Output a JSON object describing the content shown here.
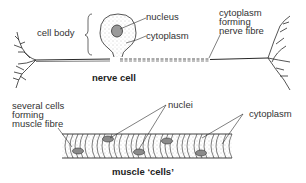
{
  "nerve_cell": {
    "caption": "nerve cell",
    "labels": {
      "cell_body": "cell body",
      "nucleus": "nucleus",
      "cytoplasm": "cytoplasm",
      "fibre_line1": "cytoplasm",
      "fibre_line2": "forming",
      "fibre_line3": "nerve fibre"
    }
  },
  "muscle_cells": {
    "caption": "muscle ‘cells’",
    "labels": {
      "several_line1": "several cells",
      "several_line2": "forming",
      "several_line3": "muscle fibre",
      "nuclei": "nuclei",
      "cytoplasm": "cytoplasm"
    }
  },
  "colors": {
    "ink": "#2a2a2a",
    "background": "#ffffff"
  }
}
